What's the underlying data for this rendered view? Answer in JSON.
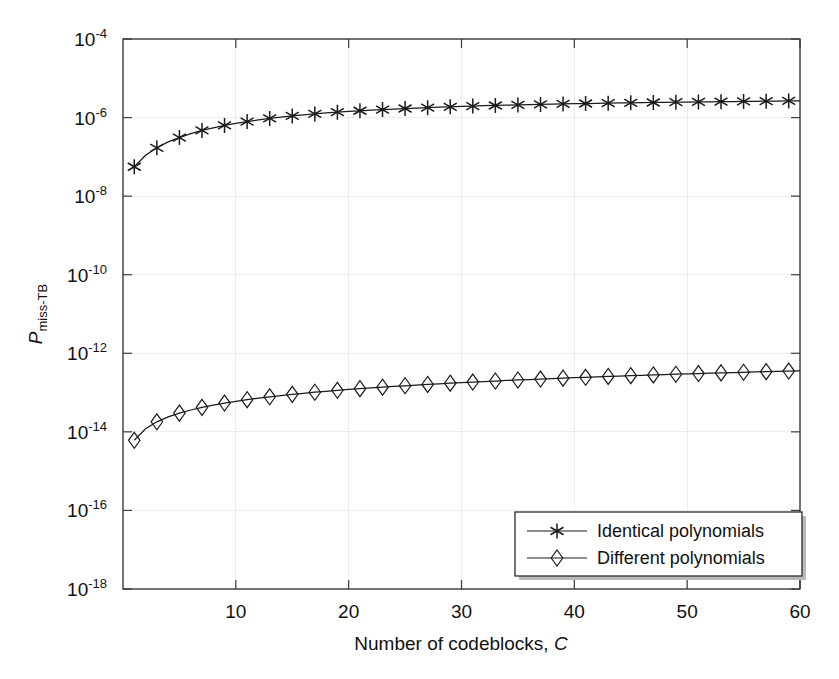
{
  "chart_data": {
    "type": "line",
    "title": "",
    "xlabel": "Number of codeblocks, C",
    "xlabel_main": "Number of codeblocks,",
    "xlabel_italic": "C",
    "ylabel": "P_miss-TB",
    "ylabel_italic": "P",
    "ylabel_sub": "miss-TB",
    "xlim": [
      0,
      60
    ],
    "ylim": [
      1e-18,
      0.0001
    ],
    "yscale": "log",
    "xscale": "linear",
    "grid": true,
    "legend_position": "lower right",
    "xticks": [
      10,
      20,
      30,
      40,
      50,
      60
    ],
    "xtick_labels": [
      "10",
      "20",
      "30",
      "40",
      "50",
      "60"
    ],
    "yticks": [
      0.0001,
      1e-06,
      1e-08,
      1e-10,
      1e-12,
      1e-14,
      1e-16,
      1e-18
    ],
    "ytick_labels": [
      "10⁻⁴",
      "10⁻⁶",
      "10⁻⁸",
      "10⁻¹⁰",
      "10⁻¹²",
      "10⁻¹⁴",
      "10⁻¹⁶",
      "10⁻¹⁸"
    ],
    "ytick_bases": [
      "10",
      "10",
      "10",
      "10",
      "10",
      "10",
      "10",
      "10"
    ],
    "ytick_exponents": [
      "-4",
      "-6",
      "-8",
      "-10",
      "-12",
      "-14",
      "-16",
      "-18"
    ],
    "series": [
      {
        "name": "Identical polynomials",
        "marker": "star",
        "marker_every": 2,
        "x": [
          1,
          2,
          3,
          4,
          5,
          6,
          7,
          8,
          9,
          10,
          11,
          12,
          13,
          14,
          15,
          16,
          17,
          18,
          19,
          20,
          21,
          22,
          23,
          24,
          25,
          26,
          27,
          28,
          29,
          30,
          31,
          32,
          33,
          34,
          35,
          36,
          37,
          38,
          39,
          40,
          41,
          42,
          43,
          44,
          45,
          46,
          47,
          48,
          49,
          50,
          51,
          52,
          53,
          54,
          55,
          56,
          57,
          58,
          59,
          60
        ],
        "y": [
          5.6e-08,
          1.1e-07,
          1.7e-07,
          2.4e-07,
          3.1e-07,
          3.9e-07,
          4.7e-07,
          5.5e-07,
          6.3e-07,
          7.1e-07,
          7.9e-07,
          8.7e-07,
          9.5e-07,
          1.03e-06,
          1.1e-06,
          1.17e-06,
          1.24e-06,
          1.31e-06,
          1.37e-06,
          1.43e-06,
          1.49e-06,
          1.55e-06,
          1.6e-06,
          1.65e-06,
          1.7e-06,
          1.75e-06,
          1.79e-06,
          1.84e-06,
          1.88e-06,
          1.92e-06,
          1.96e-06,
          2e-06,
          2.03e-06,
          2.07e-06,
          2.1e-06,
          2.13e-06,
          2.16e-06,
          2.19e-06,
          2.22e-06,
          2.25e-06,
          2.28e-06,
          2.3e-06,
          2.33e-06,
          2.35e-06,
          2.38e-06,
          2.4e-06,
          2.42e-06,
          2.44e-06,
          2.46e-06,
          2.48e-06,
          2.5e-06,
          2.52e-06,
          2.54e-06,
          2.56e-06,
          2.58e-06,
          2.6e-06,
          2.61e-06,
          2.63e-06,
          2.65e-06,
          2.66e-06
        ]
      },
      {
        "name": "Different polynomials",
        "marker": "diamond",
        "marker_every": 2,
        "x": [
          1,
          2,
          3,
          4,
          5,
          6,
          7,
          8,
          9,
          10,
          11,
          12,
          13,
          14,
          15,
          16,
          17,
          18,
          19,
          20,
          21,
          22,
          23,
          24,
          25,
          26,
          27,
          28,
          29,
          30,
          31,
          32,
          33,
          34,
          35,
          36,
          37,
          38,
          39,
          40,
          41,
          42,
          43,
          44,
          45,
          46,
          47,
          48,
          49,
          50,
          51,
          52,
          53,
          54,
          55,
          56,
          57,
          58,
          59,
          60
        ],
        "y": [
          6.1e-15,
          1.2e-14,
          1.8e-14,
          2.4e-14,
          3e-14,
          3.6e-14,
          4.2e-14,
          4.8e-14,
          5.4e-14,
          6e-14,
          6.6e-14,
          7.2e-14,
          7.8e-14,
          8.4e-14,
          9e-14,
          9.6e-14,
          1.02e-13,
          1.08e-13,
          1.14e-13,
          1.2e-13,
          1.26e-13,
          1.32e-13,
          1.37e-13,
          1.43e-13,
          1.49e-13,
          1.55e-13,
          1.61e-13,
          1.67e-13,
          1.73e-13,
          1.79e-13,
          1.85e-13,
          1.91e-13,
          1.97e-13,
          2.03e-13,
          2.09e-13,
          2.15e-13,
          2.21e-13,
          2.27e-13,
          2.33e-13,
          2.39e-13,
          2.45e-13,
          2.51e-13,
          2.57e-13,
          2.63e-13,
          2.69e-13,
          2.75e-13,
          2.81e-13,
          2.87e-13,
          2.93e-13,
          2.99e-13,
          3.05e-13,
          3.11e-13,
          3.17e-13,
          3.23e-13,
          3.29e-13,
          3.35e-13,
          3.41e-13,
          3.47e-13,
          3.53e-13,
          3.59e-13
        ]
      }
    ]
  },
  "legend": {
    "entries": [
      {
        "label": "Identical polynomials",
        "marker": "star"
      },
      {
        "label": "Different polynomials",
        "marker": "diamond"
      }
    ]
  },
  "colors": {
    "line": "#1b1b1b",
    "axis": "#3a3a3a",
    "grid": "#ededed",
    "background": "#ffffff"
  }
}
